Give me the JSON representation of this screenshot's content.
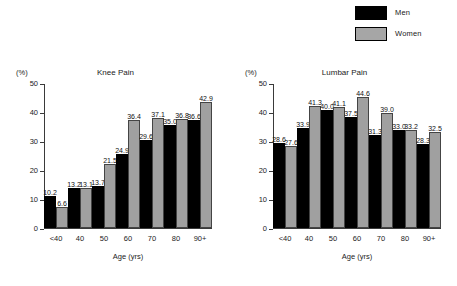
{
  "legend": {
    "position": "top-right",
    "items": [
      {
        "label": "Men",
        "color": "#000000"
      },
      {
        "label": "Women",
        "color": "#a0a0a0"
      }
    ]
  },
  "axis": {
    "y_unit": "(%)",
    "x_title": "Age (yrs)",
    "y_ticks": [
      "0",
      "10",
      "20",
      "30",
      "40",
      "50"
    ]
  },
  "chart_data": [
    {
      "type": "bar",
      "title": "Knee Pain",
      "xlabel": "Age (yrs)",
      "ylabel": "(%)",
      "ylim": [
        0,
        50
      ],
      "grid": false,
      "legend_position": "top-right",
      "categories": [
        "<40",
        "40",
        "50",
        "60",
        "70",
        "80",
        "90+"
      ],
      "series": [
        {
          "name": "Men",
          "color": "#000000",
          "values": [
            10.2,
            13.2,
            13.7,
            24.9,
            29.6,
            35.0,
            36.6
          ]
        },
        {
          "name": "Women",
          "color": "#a0a0a0",
          "values": [
            6.6,
            13.1,
            21.5,
            36.4,
            37.1,
            36.8,
            42.9
          ]
        }
      ]
    },
    {
      "type": "bar",
      "title": "Lumbar Pain",
      "xlabel": "Age (yrs)",
      "ylabel": "(%)",
      "ylim": [
        0,
        50
      ],
      "grid": false,
      "legend_position": "top-right",
      "categories": [
        "<40",
        "40",
        "50",
        "60",
        "70",
        "80",
        "90+"
      ],
      "series": [
        {
          "name": "Men",
          "color": "#000000",
          "values": [
            28.6,
            33.9,
            40.0,
            37.5,
            31.3,
            33.0,
            28.3
          ]
        },
        {
          "name": "Women",
          "color": "#a0a0a0",
          "values": [
            27.6,
            41.3,
            41.1,
            44.6,
            39.0,
            33.2,
            32.5
          ]
        }
      ]
    }
  ]
}
